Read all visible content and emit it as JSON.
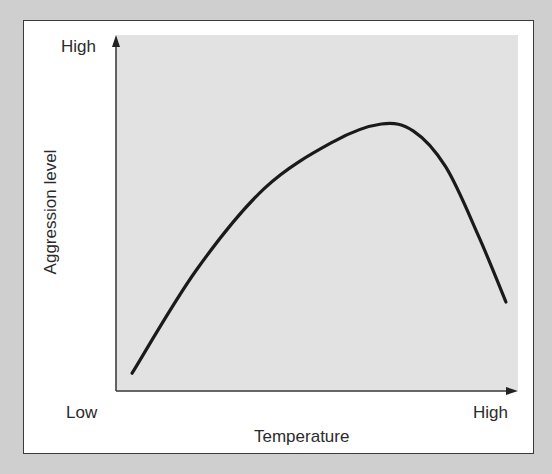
{
  "chart_data": {
    "type": "line",
    "title": "",
    "xlabel": "Temperature",
    "ylabel": "Aggression level",
    "x_tick_labels": [
      "Low",
      "High"
    ],
    "y_tick_labels": [
      "High"
    ],
    "grid": false,
    "legend": null,
    "series": [
      {
        "name": "Aggression vs temperature (inverted-U)",
        "x": [
          0.04,
          0.2,
          0.37,
          0.54,
          0.66,
          0.74,
          0.82,
          0.9,
          0.97
        ],
        "y": [
          0.05,
          0.34,
          0.57,
          0.7,
          0.75,
          0.73,
          0.63,
          0.44,
          0.25
        ]
      }
    ],
    "xlim": [
      0,
      1
    ],
    "ylim": [
      0,
      1
    ],
    "colors": {
      "curve": "#1a1a1a",
      "plot_background": "#e2e2e2",
      "page_background": "#cfcfcf"
    }
  },
  "labels": {
    "y_high": "High",
    "x_low": "Low",
    "x_high": "High",
    "x_title": "Temperature",
    "y_title": "Aggression level"
  }
}
